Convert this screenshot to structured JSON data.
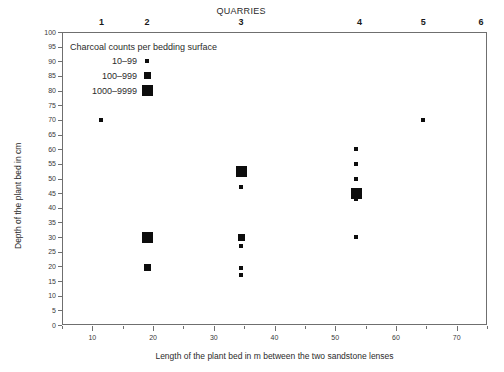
{
  "chart_data": {
    "type": "scatter",
    "title": "",
    "xlabel": "Length of the plant bed in m between the two sandstone lenses",
    "ylabel": "Depth of the plant bed in cm",
    "secondary_axis_label": "QUARRIES",
    "xlim": [
      5,
      75
    ],
    "ylim": [
      0,
      100
    ],
    "grid": false,
    "legend_position": "top-left inside plot",
    "x_ticks": [
      10,
      20,
      30,
      40,
      50,
      60,
      70
    ],
    "x_minor_ticks": [
      5,
      15,
      25,
      35,
      45,
      55,
      65,
      75
    ],
    "y_ticks": [
      0,
      5,
      10,
      15,
      20,
      25,
      30,
      35,
      40,
      45,
      50,
      55,
      60,
      65,
      70,
      75,
      80,
      85,
      90,
      95,
      100
    ],
    "quarry_ticks": [
      {
        "label": "1",
        "x": 11.5
      },
      {
        "label": "2",
        "x": 19.0
      },
      {
        "label": "3",
        "x": 34.5
      },
      {
        "label": "4",
        "x": 54.0
      },
      {
        "label": "5",
        "x": 64.5
      },
      {
        "label": "6",
        "x": 74.0
      }
    ],
    "legend": {
      "title": "Charcoal counts per bedding surface",
      "entries": [
        {
          "label": "10–99",
          "size_px": 4,
          "y": 90
        },
        {
          "label": "100–999",
          "size_px": 7,
          "y": 85
        },
        {
          "label": "1000–9999",
          "size_px": 11,
          "y": 80
        }
      ],
      "swatch_x": 19.0
    },
    "marker_color": "#0d0d0d",
    "marker_sizes_px": {
      "small": 4,
      "medium": 7,
      "large": 11
    },
    "points": [
      {
        "quarry": 1,
        "x": 11.5,
        "y": 70,
        "size": "small"
      },
      {
        "quarry": 2,
        "x": 19.0,
        "y": 30,
        "size": "large"
      },
      {
        "quarry": 2,
        "x": 19.0,
        "y": 19.5,
        "size": "medium"
      },
      {
        "quarry": 3,
        "x": 34.5,
        "y": 52.5,
        "size": "large"
      },
      {
        "quarry": 3,
        "x": 34.5,
        "y": 47,
        "size": "small"
      },
      {
        "quarry": 3,
        "x": 34.5,
        "y": 30,
        "size": "medium"
      },
      {
        "quarry": 3,
        "x": 34.5,
        "y": 27,
        "size": "small"
      },
      {
        "quarry": 3,
        "x": 34.5,
        "y": 19.5,
        "size": "small"
      },
      {
        "quarry": 3,
        "x": 34.5,
        "y": 17,
        "size": "small"
      },
      {
        "quarry": 4,
        "x": 53.5,
        "y": 60,
        "size": "small"
      },
      {
        "quarry": 4,
        "x": 53.5,
        "y": 55,
        "size": "small"
      },
      {
        "quarry": 4,
        "x": 53.5,
        "y": 50,
        "size": "small"
      },
      {
        "quarry": 4,
        "x": 53.5,
        "y": 45,
        "size": "large"
      },
      {
        "quarry": 4,
        "x": 53.5,
        "y": 43,
        "size": "small"
      },
      {
        "quarry": 4,
        "x": 53.5,
        "y": 30,
        "size": "small"
      },
      {
        "quarry": 5,
        "x": 64.5,
        "y": 70,
        "size": "small"
      }
    ]
  }
}
